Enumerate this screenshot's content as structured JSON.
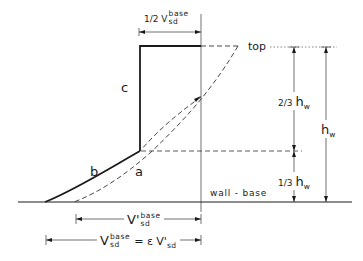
{
  "diagram": {
    "labels": {
      "top": "top",
      "wall_base": "wall - base",
      "curve_a": "a",
      "curve_b": "b",
      "curve_c": "c",
      "half_v": {
        "prefix": "1/2 V",
        "sup": "base",
        "sub": "sd"
      },
      "two_thirds_hw": {
        "prefix": "2/3",
        "main": "h",
        "sub": "w"
      },
      "one_third_hw": {
        "prefix": "1/3",
        "main": "h",
        "sub": "w"
      },
      "hw": {
        "main": "h",
        "sub": "w"
      },
      "v_prime_base": {
        "main": "V'",
        "sup": "base",
        "sub": "sd"
      },
      "v_base": {
        "main": "V",
        "sup": "base",
        "sub": "sd",
        "equals": "= ε V'",
        "equals_sub": "sd"
      }
    },
    "colors": {
      "line": "#1a1a1a",
      "thin": "#333333",
      "background": "#ffffff"
    }
  }
}
